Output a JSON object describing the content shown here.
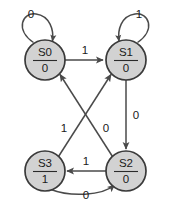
{
  "diagram": {
    "type": "state-transition-diagram",
    "colors": {
      "node_fill": "#d2d2d2",
      "node_stroke": "#3a3a3a",
      "edge_stroke": "#4a4a4a",
      "text": "#1a1a1a",
      "background": "#ffffff"
    },
    "nodes": [
      {
        "id": "S0",
        "state_label": "S0",
        "output_label": "0",
        "cx": 45,
        "cy": 60,
        "r": 20
      },
      {
        "id": "S1",
        "state_label": "S1",
        "output_label": "0",
        "cx": 126,
        "cy": 60,
        "r": 20
      },
      {
        "id": "S3",
        "state_label": "S3",
        "output_label": "1",
        "cx": 45,
        "cy": 171,
        "r": 20
      },
      {
        "id": "S2",
        "state_label": "S2",
        "output_label": "0",
        "cx": 126,
        "cy": 171,
        "r": 20
      }
    ],
    "edges": [
      {
        "id": "e-s0-s0",
        "from": "S0",
        "to": "S0",
        "label": "0",
        "label_x": 31,
        "label_y": 15,
        "kind": "self-loop"
      },
      {
        "id": "e-s1-s1",
        "from": "S1",
        "to": "S1",
        "label": "1",
        "label_x": 139,
        "label_y": 15,
        "kind": "self-loop"
      },
      {
        "id": "e-s0-s1",
        "from": "S0",
        "to": "S1",
        "label": "1",
        "label_x": 85,
        "label_y": 51,
        "kind": "straight"
      },
      {
        "id": "e-s1-s2",
        "from": "S1",
        "to": "S2",
        "label": "0",
        "label_x": 136,
        "label_y": 116,
        "kind": "straight"
      },
      {
        "id": "e-s2-s0",
        "from": "S2",
        "to": "S0",
        "label": "0",
        "label_x": 106,
        "label_y": 129,
        "kind": "diagonal"
      },
      {
        "id": "e-s3-s1",
        "from": "S3",
        "to": "S1",
        "label": "1",
        "label_x": 64,
        "label_y": 129,
        "kind": "diagonal"
      },
      {
        "id": "e-s2-s3",
        "from": "S2",
        "to": "S3",
        "label": "1",
        "label_x": 86,
        "label_y": 162,
        "kind": "straight"
      },
      {
        "id": "e-s3-s2",
        "from": "S3",
        "to": "S2",
        "label": "0",
        "label_x": 86,
        "label_y": 196,
        "kind": "curved"
      }
    ]
  }
}
